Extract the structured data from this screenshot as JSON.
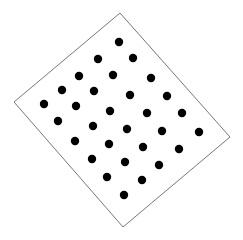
{
  "diagram": {
    "frame_color": "#777777",
    "dot_color": "#000000",
    "dot_count": 30
  }
}
